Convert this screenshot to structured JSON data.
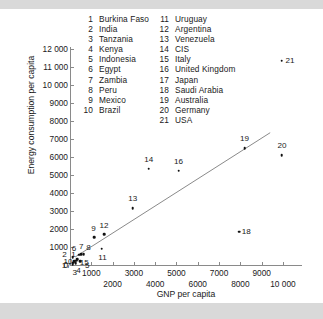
{
  "chart_data": {
    "type": "scatter",
    "title": "",
    "xlabel": "GNP per capita",
    "ylabel": "Energy consumption per capita",
    "xlim": [
      0,
      10800
    ],
    "ylim": [
      0,
      12000
    ],
    "grid": false,
    "legend_position": "top",
    "x_ticks": [
      1000,
      2000,
      3000,
      4000,
      5000,
      6000,
      7000,
      8000,
      9000,
      10000
    ],
    "x_tick_labels": [
      "1000",
      "2000",
      "3000",
      "4000",
      "5000",
      "6000",
      "7000",
      "8000",
      "9000",
      "10 000"
    ],
    "y_ticks": [
      0,
      1000,
      2000,
      3000,
      4000,
      5000,
      6000,
      7000,
      8000,
      9000,
      10000,
      11000,
      12000
    ],
    "y_tick_labels": [
      "0",
      "1000",
      "2000",
      "3000",
      "4000",
      "5000",
      "6000",
      "7000",
      "8000",
      "9000",
      "10 000",
      "11 000",
      "12 000"
    ],
    "annotations": [
      "Points are labelled with country index numbers listed in the key above the plot."
    ],
    "series": [
      {
        "name": "Countries",
        "points": [
          {
            "id": 1,
            "label": "1",
            "country": "Burkina Faso",
            "x": 160,
            "y": 120
          },
          {
            "id": 2,
            "label": "2",
            "country": "India",
            "x": 120,
            "y": 430
          },
          {
            "id": 3,
            "label": "3",
            "country": "Tanzania",
            "x": 130,
            "y": 60
          },
          {
            "id": 4,
            "label": "4",
            "country": "Kenya",
            "x": 260,
            "y": 110
          },
          {
            "id": 5,
            "label": "5",
            "country": "Indonesia",
            "x": 480,
            "y": 220
          },
          {
            "id": 6,
            "label": "6",
            "country": "Egypt",
            "x": 420,
            "y": 580
          },
          {
            "id": 7,
            "label": "7",
            "country": "Zambia",
            "x": 530,
            "y": 610
          },
          {
            "id": 8,
            "label": "8",
            "country": "Peru",
            "x": 640,
            "y": 600
          },
          {
            "id": 9,
            "label": "9",
            "country": "Mexico",
            "x": 1150,
            "y": 1550
          },
          {
            "id": 10,
            "label": "10",
            "country": "Brazil",
            "x": 330,
            "y": 330
          },
          {
            "id": 11,
            "label": "11",
            "country": "Uruguay",
            "x": 1480,
            "y": 900
          },
          {
            "id": 12,
            "label": "12",
            "country": "Argentina",
            "x": 1600,
            "y": 1700
          },
          {
            "id": 13,
            "label": "13",
            "country": "Venezuela",
            "x": 2950,
            "y": 3150
          },
          {
            "id": 14,
            "label": "14",
            "country": "CIS",
            "x": 3700,
            "y": 5350
          },
          {
            "id": 15,
            "label": "15",
            "country": "Italy",
            "x": 300,
            "y": 250
          },
          {
            "id": 16,
            "label": "16",
            "country": "United Kingdom",
            "x": 5100,
            "y": 5250
          },
          {
            "id": 17,
            "label": "17",
            "country": "Japan",
            "x": 200,
            "y": 200
          },
          {
            "id": 18,
            "label": "18",
            "country": "Saudi Arabia",
            "x": 7950,
            "y": 1850
          },
          {
            "id": 19,
            "label": "19",
            "country": "Australia",
            "x": 8200,
            "y": 6500
          },
          {
            "id": 20,
            "label": "20",
            "country": "Germany",
            "x": 9950,
            "y": 6100
          },
          {
            "id": 21,
            "label": "21",
            "country": "USA",
            "x": 9950,
            "y": 11350
          }
        ]
      }
    ],
    "trend_line": {
      "name": "regression-line",
      "x_start": 250,
      "y_start": 450,
      "x_end": 9400,
      "y_end": 7350
    }
  },
  "legend": {
    "column_a": [
      {
        "num": "1",
        "name": "Burkina Faso"
      },
      {
        "num": "2",
        "name": "India"
      },
      {
        "num": "3",
        "name": "Tanzania"
      },
      {
        "num": "4",
        "name": "Kenya"
      },
      {
        "num": "5",
        "name": "Indonesia"
      },
      {
        "num": "6",
        "name": "Egypt"
      },
      {
        "num": "7",
        "name": "Zambia"
      },
      {
        "num": "8",
        "name": "Peru"
      },
      {
        "num": "9",
        "name": "Mexico"
      },
      {
        "num": "10",
        "name": "Brazil"
      }
    ],
    "column_b": [
      {
        "num": "11",
        "name": "Uruguay"
      },
      {
        "num": "12",
        "name": "Argentina"
      },
      {
        "num": "13",
        "name": "Venezuela"
      },
      {
        "num": "14",
        "name": "CIS"
      },
      {
        "num": "15",
        "name": "Italy"
      },
      {
        "num": "16",
        "name": "United Kingdom"
      },
      {
        "num": "17",
        "name": "Japan"
      },
      {
        "num": "18",
        "name": "Saudi Arabia"
      },
      {
        "num": "19",
        "name": "Australia"
      },
      {
        "num": "20",
        "name": "Germany"
      },
      {
        "num": "21",
        "name": "USA"
      }
    ]
  },
  "colors": {
    "background": "#ffffff",
    "band": "#d9d9d9",
    "axis": "#8a8a8a",
    "marker": "#111111",
    "text": "#1a1a1a",
    "trend": "#8a8a8a"
  }
}
